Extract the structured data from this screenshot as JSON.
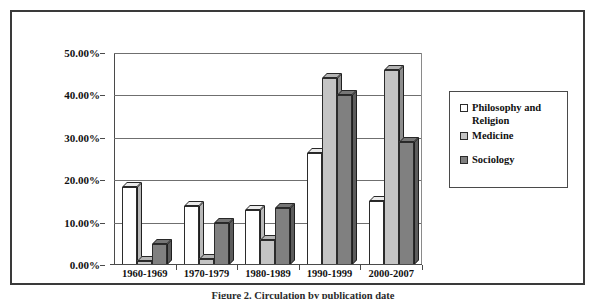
{
  "figure": {
    "caption": "Figure 2. Circulation by publication date"
  },
  "legend": {
    "position": "right",
    "items": [
      {
        "label": "Philosophy and Religion",
        "color": "#ffffff",
        "name": "legend-philosophy-and-religion"
      },
      {
        "label": "Medicine",
        "color": "#c4c4c4",
        "name": "legend-medicine"
      },
      {
        "label": "Sociology",
        "color": "#808080",
        "name": "legend-sociology"
      }
    ]
  },
  "axis": {
    "y_ticks": [
      "0.00%",
      "10.00%",
      "20.00%",
      "30.00%",
      "40.00%",
      "50.00%"
    ],
    "x_ticks": [
      "1960-1969",
      "1970-1979",
      "1980-1989",
      "1990-1999",
      "2000-2007"
    ]
  },
  "chart_data": {
    "type": "bar",
    "title": "",
    "xlabel": "",
    "ylabel": "",
    "ylim": [
      0,
      50
    ],
    "ytick_values": [
      0,
      10,
      20,
      30,
      40,
      50
    ],
    "ytick_labels": [
      "0.00%",
      "10.00%",
      "20.00%",
      "30.00%",
      "40.00%",
      "50.00%"
    ],
    "grid": true,
    "grid_axis": "y",
    "value_format": "percent",
    "legend_position": "right",
    "style": "3d-column",
    "categories": [
      "1960-1969",
      "1970-1979",
      "1980-1989",
      "1990-1999",
      "2000-2007"
    ],
    "series": [
      {
        "name": "Philosophy and Religion",
        "color": "#ffffff",
        "values": [
          18.5,
          14.0,
          13.0,
          26.5,
          15.0
        ]
      },
      {
        "name": "Medicine",
        "color": "#c4c4c4",
        "values": [
          1.0,
          1.5,
          6.0,
          44.0,
          46.0
        ]
      },
      {
        "name": "Sociology",
        "color": "#808080",
        "values": [
          5.0,
          10.0,
          13.5,
          40.0,
          29.0
        ]
      }
    ]
  },
  "colors": {
    "frame": "#3a3a3a",
    "axis": "#4a4a4a",
    "gridline": "#6f6f6f",
    "bar_outline": "#2b2b2b",
    "text": "#111111"
  }
}
